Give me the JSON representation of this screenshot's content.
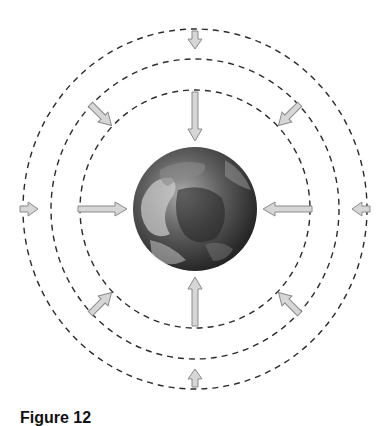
{
  "figure": {
    "caption": "Figure 12",
    "center": [
      195,
      209
    ],
    "earth_radius": 62,
    "circle_radii": [
      117,
      147,
      176
    ],
    "colors": {
      "dash": "#2a2a2a",
      "arrow_fill": "#d6d6d6",
      "arrow_stroke": "#8a8a8a",
      "earth_dark": "#2b2b2b",
      "earth_light": "#bdbdbd"
    },
    "arrows": [
      {
        "name": "arrow-top-inner",
        "angle": -90,
        "from": 117,
        "to": 68
      },
      {
        "name": "arrow-bottom-inner",
        "angle": 90,
        "from": 117,
        "to": 68
      },
      {
        "name": "arrow-left-inner",
        "angle": 180,
        "from": 117,
        "to": 68
      },
      {
        "name": "arrow-right-inner",
        "angle": 0,
        "from": 117,
        "to": 68
      },
      {
        "name": "arrow-top-outer",
        "angle": -90,
        "from": 178,
        "to": 160
      },
      {
        "name": "arrow-bottom-outer",
        "angle": 90,
        "from": 178,
        "to": 160
      },
      {
        "name": "arrow-left-outer",
        "angle": 180,
        "from": 175,
        "to": 157
      },
      {
        "name": "arrow-right-outer",
        "angle": 0,
        "from": 175,
        "to": 157
      },
      {
        "name": "arrow-topleft-diag",
        "angle": -135,
        "from": 148,
        "to": 118
      },
      {
        "name": "arrow-topright-diag",
        "angle": -45,
        "from": 148,
        "to": 118
      },
      {
        "name": "arrow-bottomleft-diag",
        "angle": 135,
        "from": 148,
        "to": 118
      },
      {
        "name": "arrow-bottomright-diag",
        "angle": 45,
        "from": 148,
        "to": 118
      }
    ]
  }
}
